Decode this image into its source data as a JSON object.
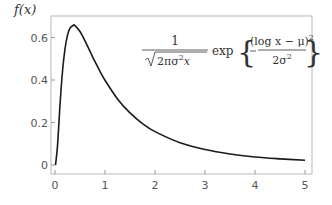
{
  "chart_data": {
    "type": "line",
    "title": "",
    "xlabel": "",
    "ylabel": "f(x)",
    "xlim": [
      -0.1,
      5.15
    ],
    "ylim": [
      -0.04,
      0.7
    ],
    "grid": false,
    "legend": null,
    "x_ticks": [
      0,
      1,
      2,
      3,
      4,
      5
    ],
    "x_tick_labels": [
      "0",
      "1",
      "2",
      "3",
      "4",
      "5"
    ],
    "y_ticks": [
      0,
      0.2,
      0.4,
      0.6
    ],
    "y_tick_labels": [
      "0",
      "0.2",
      "0.4",
      "0.6"
    ],
    "annotation": {
      "text": "1/sqrt(2πσ²x) exp{ −(log x − μ)² / (2σ²) }",
      "numerator": "1",
      "denominator_radical": "2πσ",
      "denominator_tail": "x",
      "exp_label": "exp",
      "inner_numerator": "(log x − μ)",
      "inner_denominator": "2σ"
    },
    "series": [
      {
        "name": "lognormal pdf (μ=0, σ=1)",
        "color": "#1a1a1a",
        "x": [
          0.01,
          0.05,
          0.1,
          0.15,
          0.2,
          0.25,
          0.3,
          0.368,
          0.4,
          0.5,
          0.6,
          0.7,
          0.8,
          0.9,
          1.0,
          1.25,
          1.5,
          1.75,
          2.0,
          2.5,
          3.0,
          3.5,
          4.0,
          4.5,
          5.0
        ],
        "y": [
          0.0,
          0.09,
          0.282,
          0.44,
          0.546,
          0.611,
          0.644,
          0.658,
          0.656,
          0.628,
          0.584,
          0.535,
          0.486,
          0.441,
          0.399,
          0.311,
          0.245,
          0.195,
          0.157,
          0.105,
          0.073,
          0.052,
          0.038,
          0.029,
          0.022
        ]
      }
    ]
  },
  "labels": {
    "ylabel": "f(x)"
  }
}
